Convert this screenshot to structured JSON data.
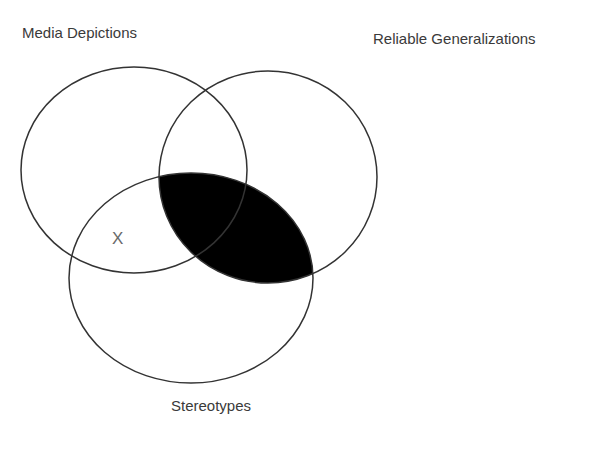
{
  "diagram": {
    "type": "venn",
    "sets": [
      {
        "id": "A",
        "label": "Media Depictions",
        "cx": 134,
        "cy": 170,
        "rx": 113,
        "ry": 103
      },
      {
        "id": "B",
        "label": "Reliable Generalizations",
        "cx": 268,
        "cy": 177,
        "rx": 109,
        "ry": 106
      },
      {
        "id": "C",
        "label": "Stereotypes",
        "cx": 191,
        "cy": 278,
        "rx": 122,
        "ry": 105
      }
    ],
    "shaded_region": {
      "description": "Reliable Generalizations ∩ Stereotypes",
      "color": "#000000"
    },
    "marks": [
      {
        "text": "X",
        "region": "Media Depictions ∩ Stereotypes, outside Reliable Generalizations"
      }
    ],
    "stroke_color": "#333333"
  }
}
